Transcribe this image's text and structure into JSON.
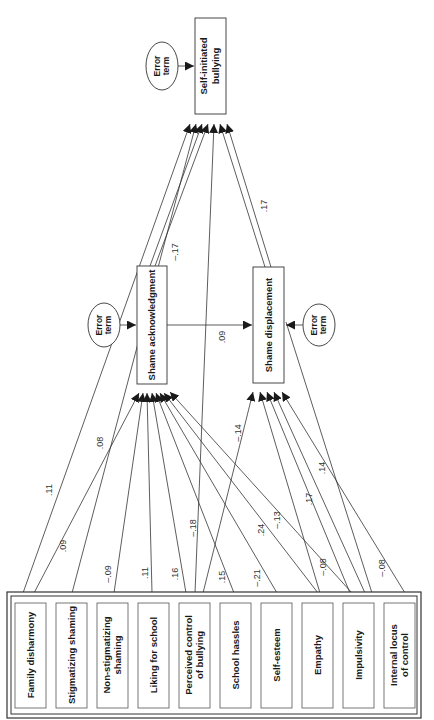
{
  "diagram": {
    "type": "path-model",
    "orientation": "rotated-90-ccw",
    "colors": {
      "line": "#333333",
      "text": "#1a1a1a",
      "background": "#ffffff"
    },
    "outcome": {
      "id": "sib",
      "label_lines": [
        "Self-initiated",
        "bullying"
      ]
    },
    "mediators": [
      {
        "id": "sa",
        "label": "Shame acknowledgment"
      },
      {
        "id": "sd",
        "label": "Shame displacement"
      }
    ],
    "error_terms": [
      {
        "id": "e_sib",
        "label_lines": [
          "Error",
          "term"
        ],
        "target": "sib"
      },
      {
        "id": "e_sa",
        "label_lines": [
          "Error",
          "term"
        ],
        "target": "sa"
      },
      {
        "id": "e_sd",
        "label_lines": [
          "Error",
          "term"
        ],
        "target": "sd"
      }
    ],
    "predictors": [
      {
        "id": "p1",
        "label_lines": [
          "Family disharmony"
        ]
      },
      {
        "id": "p2",
        "label_lines": [
          "Stigmatizing shaming"
        ]
      },
      {
        "id": "p3",
        "label_lines": [
          "Non-stigmatizing",
          "shaming"
        ]
      },
      {
        "id": "p4",
        "label_lines": [
          "Liking for school"
        ]
      },
      {
        "id": "p5",
        "label_lines": [
          "Perceived control",
          "of bullying"
        ]
      },
      {
        "id": "p6",
        "label_lines": [
          "School hassles"
        ]
      },
      {
        "id": "p7",
        "label_lines": [
          "Self-esteem"
        ]
      },
      {
        "id": "p8",
        "label_lines": [
          "Empathy"
        ]
      },
      {
        "id": "p9",
        "label_lines": [
          "Impulsivity"
        ]
      },
      {
        "id": "p10",
        "label_lines": [
          "Internal locus",
          "of control"
        ]
      }
    ],
    "paths": [
      {
        "from": "p1",
        "to": "sib",
        "coef": ".11"
      },
      {
        "from": "p1",
        "to": "sa",
        "coef": ".09"
      },
      {
        "from": "p2",
        "to": "sib",
        "coef": ".08"
      },
      {
        "from": "p3",
        "to": "sa",
        "coef": "–.09"
      },
      {
        "from": "p4",
        "to": "sa",
        "coef": ".11"
      },
      {
        "from": "p5",
        "to": "sa",
        "coef": ".16"
      },
      {
        "from": "p5",
        "to": "sib",
        "coef": "–.18"
      },
      {
        "from": "p6",
        "to": "sa",
        "coef": ".15"
      },
      {
        "from": "p6",
        "to": "sd",
        "coef": "–.14"
      },
      {
        "from": "p7",
        "to": "sa",
        "coef": "–.21"
      },
      {
        "from": "p8",
        "to": "sa",
        "coef": ".24"
      },
      {
        "from": "p8",
        "to": "sd",
        "coef": "–.08"
      },
      {
        "from": "p9",
        "to": "sa",
        "coef": "–.13"
      },
      {
        "from": "p9",
        "to": "sd",
        "coef": ".17"
      },
      {
        "from": "p10",
        "to": "sd",
        "coef": "–.08"
      },
      {
        "from": "sd",
        "to": "sib",
        "coef": ".14"
      },
      {
        "from": "sa",
        "to": "sib",
        "coef": "–.17"
      },
      {
        "from": "sa",
        "to": "sd",
        "coef": ".09"
      },
      {
        "from": "sd",
        "to": "sib",
        "coef": ".17"
      }
    ]
  }
}
